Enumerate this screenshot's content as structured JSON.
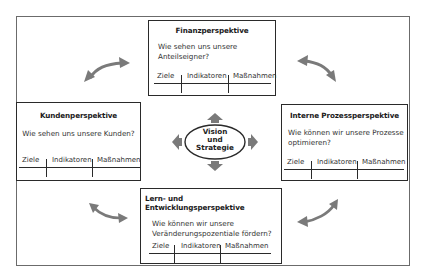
{
  "center": {
    "line1": "Vision",
    "line2": "und",
    "line3": "Strategie"
  },
  "columns_label": {
    "goals": "Ziele",
    "indicators": "Indikatoren",
    "measures": "Maßnahmen"
  },
  "perspectives": {
    "finance": {
      "title": "Finanzperspektive",
      "question_l1": "Wie sehen uns unsere",
      "question_l2": "Anteilseigner?"
    },
    "customer": {
      "title": "Kundenperspektive",
      "question_l1": "Wie sehen uns unsere Kunden?"
    },
    "process": {
      "title": "Interne Prozessperspektive",
      "question_l1": "Wie können wir unsere Prozesse",
      "question_l2": "optimieren?"
    },
    "learning": {
      "title": "Lern- und Entwicklungsperspektive",
      "question_l1": "Wie können wir unsere",
      "question_l2": "Veränderungspozentiale fördern?"
    }
  },
  "colors": {
    "arrow": "#7a7a7a",
    "border": "#2a2a2a",
    "frame": "#6b6b6b"
  }
}
